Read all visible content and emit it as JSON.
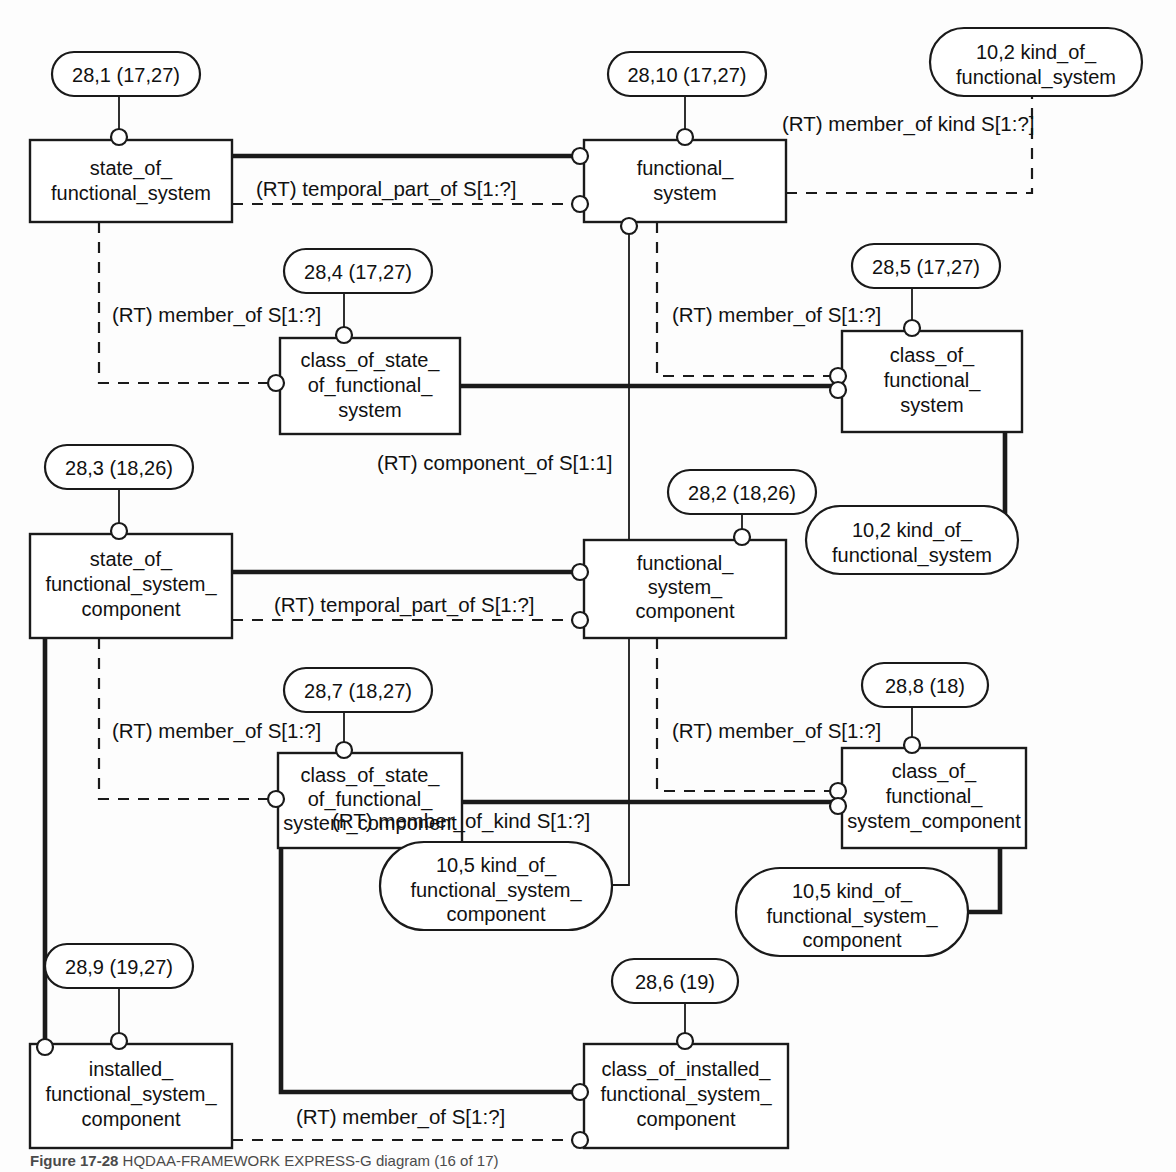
{
  "figure": {
    "caption_label": "Figure 17-28",
    "caption_text": "HQDAA-FRAMEWORK EXPRESS-G diagram (16 of 17)"
  },
  "diagram": {
    "type": "EXPRESS-G entity-relationship diagram",
    "entities": [
      {
        "id": "state_of_functional_system",
        "label_lines": [
          "state_of_",
          "functional_system"
        ],
        "ref": "28,1 (17,27)"
      },
      {
        "id": "functional_system",
        "label_lines": [
          "functional_",
          "system"
        ],
        "ref": "28,10 (17,27)"
      },
      {
        "id": "class_of_state_of_functional_system",
        "label_lines": [
          "class_of_state_",
          "of_functional_",
          "system"
        ],
        "ref": "28,4 (17,27)"
      },
      {
        "id": "class_of_functional_system",
        "label_lines": [
          "class_of_",
          "functional_",
          "system"
        ],
        "ref": "28,5 (17,27)"
      },
      {
        "id": "state_of_functional_system_component",
        "label_lines": [
          "state_of_",
          "functional_system_",
          "component"
        ],
        "ref": "28,3 (18,26)"
      },
      {
        "id": "functional_system_component",
        "label_lines": [
          "functional_",
          "system_",
          "component"
        ],
        "ref": "28,2 (18,26)"
      },
      {
        "id": "class_of_state_of_functional_system_component",
        "label_lines": [
          "class_of_state_",
          "of_functional_",
          "system_component"
        ],
        "ref": "28,7 (18,27)"
      },
      {
        "id": "class_of_functional_system_component",
        "label_lines": [
          "class_of_",
          "functional_",
          "system_component"
        ],
        "ref": "28,8 (18)"
      },
      {
        "id": "installed_functional_system_component",
        "label_lines": [
          "installed_",
          "functional_system_",
          "component"
        ],
        "ref": "28,9 (19,27)"
      },
      {
        "id": "class_of_installed_functional_system_component",
        "label_lines": [
          "class_of_installed_",
          "functional_system_",
          "component"
        ],
        "ref": "28,6 (19)"
      }
    ],
    "kind_ovals": [
      {
        "id": "kind_of_functional_system_top",
        "label_lines": [
          "10,2 kind_of_",
          "functional_system"
        ]
      },
      {
        "id": "kind_of_functional_system_mid",
        "label_lines": [
          "10,2 kind_of_",
          "functional_system"
        ]
      },
      {
        "id": "kind_of_functional_system_component_left",
        "label_lines": [
          "10,5 kind_of_",
          "functional_system_",
          "component"
        ]
      },
      {
        "id": "kind_of_functional_system_component_right",
        "label_lines": [
          "10,5 kind_of_",
          "functional_system_",
          "component"
        ]
      }
    ],
    "relationships": [
      {
        "id": "rel-temporal-part-of-top",
        "label": "(RT) temporal_part_of S[1:?]"
      },
      {
        "id": "rel-member-of-kind-top",
        "label": "(RT) member_of kind S[1:?]"
      },
      {
        "id": "rel-member-of-left-upper",
        "label": "(RT) member_of S[1:?]"
      },
      {
        "id": "rel-member-of-right-upper",
        "label": "(RT) member_of S[1:?]"
      },
      {
        "id": "rel-component-of",
        "label": "(RT) component_of S[1:1]"
      },
      {
        "id": "rel-temporal-part-of-mid",
        "label": "(RT) temporal_part_of S[1:?]"
      },
      {
        "id": "rel-member-of-left-lower",
        "label": "(RT) member_of S[1:?]"
      },
      {
        "id": "rel-member-of-right-lower",
        "label": "(RT) member_of S[1:?]"
      },
      {
        "id": "rel-member-of-kind-lower",
        "label": "(RT) member_of_kind S[1:?]"
      },
      {
        "id": "rel-member-of-bottom",
        "label": "(RT) member_of S[1:?]"
      }
    ]
  }
}
